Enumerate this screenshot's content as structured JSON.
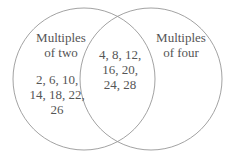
{
  "diagram": {
    "type": "venn",
    "stroke_color": "#8a8a8a",
    "text_color": "#555555",
    "sets": [
      {
        "id": "left",
        "title": "Multiples\nof two",
        "only_values": "2, 6, 10,\n14, 18, 22,\n26"
      },
      {
        "id": "right",
        "title": "Multiples\nof four",
        "only_values": ""
      }
    ],
    "intersection": {
      "values": "4, 8, 12,\n16, 20,\n24, 28"
    }
  }
}
